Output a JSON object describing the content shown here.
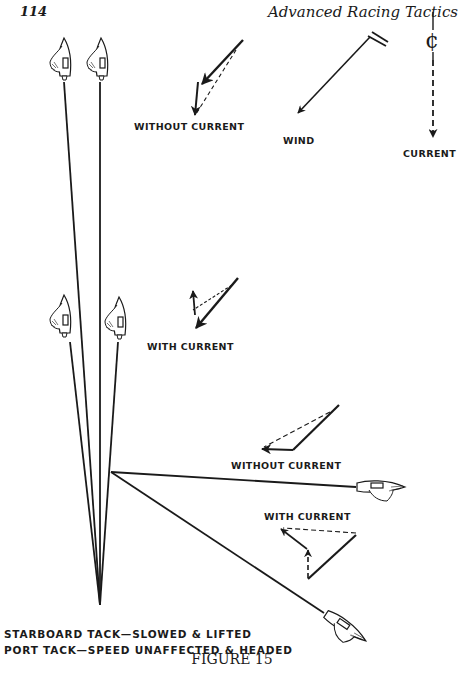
{
  "header": {
    "page_number": "114",
    "running_title": "Advanced Racing Tactics"
  },
  "legend": {
    "wind_label": "WIND",
    "current_label": "CURRENT",
    "current_symbol": "¢"
  },
  "vectors": {
    "starboard_without_current": "WITHOUT CURRENT",
    "starboard_with_current": "WITH CURRENT",
    "port_without_current": "WITHOUT CURRENT",
    "port_with_current": "WITH CURRENT"
  },
  "captions": {
    "line1": "STARBOARD TACK—SLOWED & LIFTED",
    "line2": "PORT TACK—SPEED UNAFFECTED & HEADED"
  },
  "figure_title": "FIGURE 15",
  "colors": {
    "ink": "#1a1a1a",
    "paper": "#ffffff"
  }
}
